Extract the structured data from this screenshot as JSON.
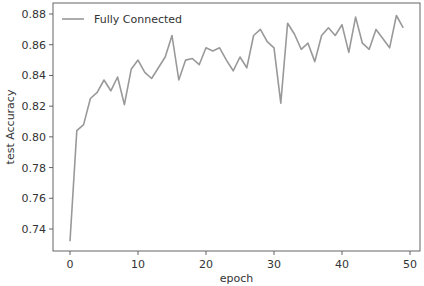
{
  "chart_data": {
    "type": "line",
    "title": "",
    "xlabel": "epoch",
    "ylabel": "test Accuracy",
    "xlim": [
      -2.5,
      51.5
    ],
    "ylim": [
      0.725,
      0.883
    ],
    "grid": false,
    "legend_position": "upper left",
    "x_ticks": [
      0,
      10,
      20,
      30,
      40,
      50
    ],
    "x_tick_labels": [
      "0",
      "10",
      "20",
      "30",
      "40",
      "50"
    ],
    "y_ticks": [
      0.74,
      0.76,
      0.78,
      0.8,
      0.82,
      0.84,
      0.86,
      0.88
    ],
    "y_tick_labels": [
      "0.74",
      "0.76",
      "0.78",
      "0.80",
      "0.82",
      "0.84",
      "0.86",
      "0.88"
    ],
    "series": [
      {
        "name": "Fully Connected",
        "color": "#999999",
        "x": [
          0,
          1,
          2,
          3,
          4,
          5,
          6,
          7,
          8,
          9,
          10,
          11,
          12,
          13,
          14,
          15,
          16,
          17,
          18,
          19,
          20,
          21,
          22,
          23,
          24,
          25,
          26,
          27,
          28,
          29,
          30,
          31,
          32,
          33,
          34,
          35,
          36,
          37,
          38,
          39,
          40,
          41,
          42,
          43,
          44,
          45,
          46,
          47,
          48,
          49
        ],
        "values": [
          0.732,
          0.804,
          0.808,
          0.825,
          0.829,
          0.837,
          0.83,
          0.839,
          0.821,
          0.844,
          0.85,
          0.842,
          0.838,
          0.845,
          0.852,
          0.866,
          0.837,
          0.85,
          0.851,
          0.847,
          0.858,
          0.856,
          0.858,
          0.85,
          0.843,
          0.852,
          0.845,
          0.866,
          0.87,
          0.862,
          0.858,
          0.822,
          0.874,
          0.867,
          0.857,
          0.861,
          0.849,
          0.866,
          0.871,
          0.866,
          0.873,
          0.855,
          0.878,
          0.861,
          0.857,
          0.87,
          0.864,
          0.858,
          0.879,
          0.871
        ]
      }
    ]
  },
  "legend": {
    "label": "Fully Connected"
  },
  "axes": {
    "xlabel": "epoch",
    "ylabel": "test Accuracy"
  }
}
